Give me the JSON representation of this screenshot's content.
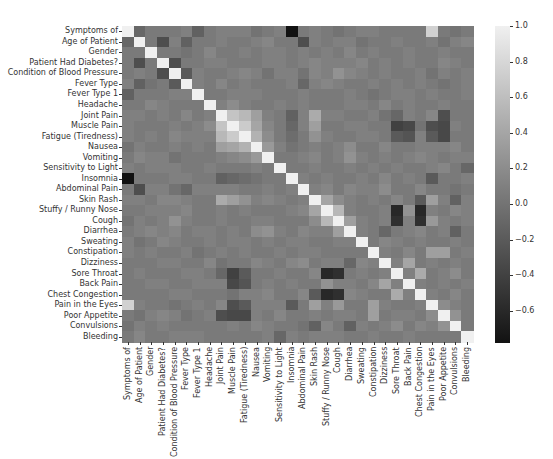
{
  "chart_data": {
    "type": "heatmap",
    "title": "",
    "xlabel": "",
    "ylabel": "",
    "labels": [
      "Symptoms of",
      "Age of Patient",
      "Gender",
      "Patient Had Diabetes?",
      "Condition of Blood Pressure",
      "Fever Type",
      "Fever Type 1",
      "Headache",
      "Joint Pain",
      "Muscle Pain",
      "Fatigue (Tiredness)",
      "Nausea",
      "Vomiting",
      "Sensitivity to Light",
      "Insomnia",
      "Abdominal Pain",
      "Skin Rash",
      "Stuffy / Runny Nose",
      "Cough",
      "Diarrhea",
      "Sweating",
      "Constipation",
      "Dizziness",
      "Sore Throat",
      "Back Pain",
      "Chest Congestion",
      "Pain in the Eyes",
      "Poor Appetite",
      "Convulsions",
      "Bleeding"
    ],
    "colorbar": {
      "min": -0.78,
      "max": 1.0,
      "ticks": [
        1.0,
        0.8,
        0.6,
        0.4,
        0.2,
        0.0,
        -0.2,
        -0.4,
        -0.6
      ],
      "tick_labels": [
        "1.0",
        "0.8",
        "0.6",
        "0.4",
        "0.2",
        "0.0",
        "−0.2",
        "−0.4",
        "−0.6"
      ],
      "colormap": "gray",
      "low_color": "#121212",
      "high_color": "#f0f0f0"
    },
    "matrix": [
      [
        1.0,
        -0.1,
        0.05,
        0.05,
        0.05,
        0.1,
        -0.15,
        0.05,
        0.1,
        0.1,
        0.1,
        0.0,
        0.05,
        0.1,
        -0.78,
        0.05,
        0.1,
        0.05,
        0.0,
        0.05,
        0.1,
        0.1,
        0.05,
        0.05,
        0.05,
        0.05,
        0.75,
        0.05,
        0.0,
        0.05
      ],
      [
        -0.1,
        1.0,
        0.05,
        -0.3,
        0.1,
        -0.15,
        0.05,
        0.05,
        0.1,
        0.05,
        0.05,
        0.1,
        0.15,
        0.05,
        0.05,
        -0.3,
        0.1,
        0.05,
        0.1,
        0.1,
        0.0,
        0.05,
        0.05,
        0.1,
        0.05,
        0.05,
        0.1,
        0.0,
        0.1,
        0.15
      ],
      [
        0.05,
        0.05,
        1.0,
        0.05,
        0.05,
        0.0,
        0.05,
        0.15,
        0.05,
        0.05,
        0.1,
        0.05,
        0.1,
        0.1,
        0.05,
        0.1,
        0.05,
        0.1,
        0.05,
        0.15,
        0.05,
        0.1,
        0.05,
        0.05,
        0.1,
        0.05,
        0.05,
        0.1,
        0.05,
        0.05
      ],
      [
        0.05,
        -0.3,
        0.05,
        1.0,
        -0.3,
        0.05,
        0.05,
        0.1,
        0.1,
        0.05,
        0.05,
        0.05,
        0.1,
        0.1,
        0.05,
        0.1,
        0.15,
        0.1,
        0.1,
        0.1,
        0.15,
        0.05,
        0.1,
        0.05,
        0.1,
        0.05,
        0.05,
        0.15,
        0.1,
        0.05
      ],
      [
        0.05,
        0.1,
        0.05,
        -0.3,
        1.0,
        -0.2,
        0.1,
        0.05,
        0.05,
        0.1,
        0.15,
        0.1,
        0.0,
        0.1,
        0.1,
        0.0,
        0.15,
        0.1,
        0.25,
        0.15,
        0.1,
        0.05,
        0.1,
        0.05,
        0.05,
        0.1,
        0.0,
        0.1,
        0.05,
        0.1
      ],
      [
        0.1,
        -0.15,
        0.0,
        0.05,
        -0.2,
        1.0,
        0.1,
        0.05,
        0.15,
        0.05,
        0.1,
        0.05,
        0.05,
        0.05,
        0.1,
        -0.1,
        0.1,
        0.15,
        0.1,
        0.05,
        0.05,
        0.1,
        0.05,
        0.1,
        0.05,
        0.1,
        0.05,
        0.0,
        0.05,
        0.1
      ],
      [
        -0.15,
        0.05,
        0.05,
        0.05,
        0.1,
        0.1,
        1.0,
        0.05,
        0.05,
        0.1,
        0.1,
        0.1,
        0.05,
        0.05,
        0.05,
        0.1,
        0.05,
        0.05,
        0.05,
        0.1,
        0.05,
        0.0,
        0.05,
        0.1,
        0.1,
        0.05,
        0.1,
        0.05,
        0.05,
        0.1
      ],
      [
        0.05,
        0.05,
        0.15,
        0.1,
        0.05,
        0.05,
        0.05,
        1.0,
        0.1,
        0.2,
        0.1,
        0.05,
        0.05,
        0.1,
        0.05,
        0.1,
        0.05,
        0.05,
        0.05,
        0.1,
        0.1,
        0.05,
        0.15,
        0.05,
        0.1,
        0.05,
        0.05,
        0.1,
        0.05,
        0.05
      ],
      [
        0.1,
        0.1,
        0.05,
        0.1,
        0.05,
        0.15,
        0.05,
        0.1,
        1.0,
        0.65,
        0.55,
        0.35,
        0.1,
        0.05,
        -0.15,
        0.1,
        0.45,
        0.1,
        0.1,
        0.05,
        0.05,
        0.1,
        0.0,
        -0.1,
        0.1,
        0.05,
        0.15,
        -0.3,
        0.05,
        0.05
      ],
      [
        0.1,
        0.05,
        0.05,
        0.05,
        0.1,
        0.05,
        0.1,
        0.2,
        0.65,
        1.0,
        0.7,
        0.4,
        0.15,
        0.05,
        -0.1,
        0.1,
        0.35,
        0.05,
        0.05,
        0.1,
        0.1,
        0.05,
        0.05,
        -0.4,
        -0.35,
        0.0,
        -0.3,
        -0.35,
        0.1,
        0.05
      ],
      [
        0.1,
        0.05,
        0.1,
        0.05,
        0.15,
        0.1,
        0.1,
        0.1,
        0.55,
        0.7,
        1.0,
        0.5,
        0.2,
        0.05,
        -0.05,
        0.05,
        0.25,
        0.1,
        0.05,
        0.05,
        0.1,
        0.1,
        0.05,
        -0.2,
        -0.25,
        0.1,
        -0.2,
        -0.35,
        0.05,
        0.05
      ],
      [
        0.0,
        0.1,
        0.05,
        0.05,
        0.1,
        0.05,
        0.1,
        0.05,
        0.35,
        0.4,
        0.5,
        1.0,
        0.3,
        0.1,
        0.0,
        0.05,
        0.1,
        0.05,
        0.1,
        0.2,
        0.05,
        0.05,
        0.15,
        0.05,
        0.05,
        0.1,
        0.1,
        0.1,
        0.15,
        0.05
      ],
      [
        0.05,
        0.15,
        0.1,
        0.1,
        0.0,
        0.05,
        0.05,
        0.05,
        0.1,
        0.15,
        0.2,
        0.3,
        1.0,
        0.05,
        0.05,
        0.1,
        0.15,
        0.05,
        0.1,
        0.25,
        0.1,
        0.05,
        0.1,
        0.05,
        0.1,
        0.15,
        0.1,
        0.05,
        0.1,
        0.1
      ],
      [
        0.1,
        0.05,
        0.1,
        0.1,
        0.1,
        0.05,
        0.05,
        0.1,
        0.05,
        0.05,
        0.05,
        0.1,
        0.05,
        1.0,
        0.05,
        0.05,
        0.1,
        0.05,
        0.05,
        0.1,
        0.05,
        0.1,
        0.05,
        0.1,
        0.05,
        0.05,
        0.1,
        0.15,
        0.05,
        -0.1
      ],
      [
        -0.78,
        0.05,
        0.05,
        0.05,
        0.1,
        0.1,
        0.05,
        0.05,
        -0.15,
        -0.1,
        -0.05,
        0.0,
        0.05,
        0.05,
        1.0,
        0.1,
        0.05,
        0.1,
        0.05,
        0.05,
        0.1,
        0.05,
        0.15,
        0.05,
        0.1,
        0.05,
        -0.2,
        0.05,
        0.05,
        0.1
      ],
      [
        0.05,
        -0.3,
        0.1,
        0.1,
        0.0,
        -0.1,
        0.1,
        0.1,
        0.1,
        0.1,
        0.05,
        0.05,
        0.1,
        0.05,
        0.1,
        1.0,
        0.1,
        0.15,
        0.05,
        0.15,
        0.1,
        0.1,
        0.2,
        0.05,
        0.05,
        0.15,
        0.05,
        0.05,
        0.0,
        0.05
      ],
      [
        0.1,
        0.1,
        0.05,
        0.15,
        0.15,
        0.1,
        0.05,
        0.05,
        0.45,
        0.35,
        0.25,
        0.1,
        0.15,
        0.1,
        0.05,
        0.1,
        1.0,
        0.4,
        0.2,
        0.1,
        0.05,
        0.1,
        0.05,
        0.15,
        0.05,
        -0.2,
        0.35,
        0.1,
        -0.15,
        0.1
      ],
      [
        0.05,
        0.05,
        0.1,
        0.1,
        0.1,
        0.15,
        0.05,
        0.05,
        0.1,
        0.05,
        0.1,
        0.05,
        0.05,
        0.05,
        0.1,
        0.15,
        0.4,
        1.0,
        0.55,
        0.1,
        0.05,
        0.05,
        0.1,
        -0.6,
        0.25,
        -0.6,
        0.1,
        0.05,
        0.15,
        0.1
      ],
      [
        0.0,
        0.1,
        0.05,
        0.1,
        0.25,
        0.1,
        0.05,
        0.05,
        0.1,
        0.05,
        0.05,
        0.1,
        0.1,
        0.05,
        0.05,
        0.05,
        0.2,
        0.55,
        1.0,
        0.35,
        0.1,
        0.05,
        0.1,
        -0.55,
        0.1,
        -0.55,
        0.3,
        0.1,
        0.05,
        0.1
      ],
      [
        0.05,
        0.1,
        0.15,
        0.1,
        0.15,
        0.05,
        0.1,
        0.1,
        0.05,
        0.1,
        0.05,
        0.2,
        0.25,
        0.1,
        0.05,
        0.15,
        0.1,
        0.1,
        0.35,
        1.0,
        0.1,
        0.05,
        -0.1,
        0.05,
        0.1,
        0.15,
        0.05,
        0.1,
        -0.15,
        0.05
      ],
      [
        0.1,
        0.0,
        0.05,
        0.15,
        0.1,
        0.05,
        0.05,
        0.1,
        0.05,
        0.1,
        0.1,
        0.05,
        0.1,
        0.05,
        0.1,
        0.1,
        0.05,
        0.05,
        0.1,
        0.1,
        1.0,
        0.05,
        0.15,
        0.1,
        0.05,
        0.1,
        0.05,
        0.05,
        0.1,
        0.05
      ],
      [
        0.1,
        0.05,
        0.1,
        0.05,
        0.05,
        0.1,
        0.0,
        0.05,
        0.1,
        0.05,
        0.1,
        0.05,
        0.05,
        0.1,
        0.05,
        0.1,
        0.1,
        0.05,
        0.05,
        0.05,
        0.05,
        1.0,
        0.1,
        0.05,
        0.15,
        0.05,
        0.35,
        0.35,
        0.05,
        0.1
      ],
      [
        0.05,
        0.05,
        0.05,
        0.1,
        0.1,
        0.05,
        0.05,
        0.15,
        0.0,
        0.05,
        0.05,
        0.15,
        0.1,
        0.05,
        0.15,
        0.2,
        0.05,
        0.1,
        0.1,
        -0.1,
        0.15,
        0.1,
        1.0,
        0.1,
        0.4,
        0.05,
        0.1,
        0.05,
        0.1,
        0.05
      ],
      [
        0.05,
        0.1,
        0.05,
        0.05,
        0.05,
        0.1,
        0.1,
        0.05,
        -0.1,
        -0.4,
        -0.2,
        0.05,
        0.05,
        0.1,
        0.05,
        0.05,
        0.15,
        -0.6,
        -0.55,
        0.05,
        0.1,
        0.05,
        0.1,
        1.0,
        0.1,
        0.45,
        0.05,
        0.1,
        0.2,
        0.05
      ],
      [
        0.05,
        0.05,
        0.1,
        0.1,
        0.05,
        0.05,
        0.1,
        0.1,
        0.1,
        -0.35,
        -0.25,
        0.05,
        0.1,
        0.05,
        0.1,
        0.05,
        0.05,
        0.25,
        0.1,
        0.1,
        0.05,
        0.15,
        0.4,
        0.1,
        1.0,
        0.1,
        0.05,
        0.1,
        0.05,
        0.1
      ],
      [
        0.05,
        0.05,
        0.05,
        0.05,
        0.1,
        0.1,
        0.05,
        0.05,
        0.05,
        0.0,
        0.1,
        0.1,
        0.15,
        0.05,
        0.05,
        0.15,
        -0.2,
        -0.6,
        -0.55,
        0.15,
        0.1,
        0.05,
        0.05,
        0.45,
        0.1,
        1.0,
        0.1,
        0.05,
        0.15,
        0.05
      ],
      [
        0.75,
        0.1,
        0.05,
        0.05,
        0.0,
        0.05,
        0.1,
        0.05,
        0.15,
        -0.3,
        -0.2,
        0.1,
        0.1,
        0.1,
        -0.2,
        0.05,
        0.35,
        0.1,
        0.3,
        0.05,
        0.05,
        0.35,
        0.1,
        0.05,
        0.05,
        0.1,
        1.0,
        0.2,
        0.1,
        0.05
      ],
      [
        0.05,
        0.0,
        0.1,
        0.15,
        0.1,
        0.0,
        0.05,
        0.1,
        -0.3,
        -0.35,
        -0.35,
        0.1,
        0.05,
        0.15,
        0.05,
        0.05,
        0.1,
        0.05,
        0.1,
        0.1,
        0.05,
        0.35,
        0.05,
        0.1,
        0.1,
        0.05,
        0.2,
        1.0,
        0.25,
        0.05
      ],
      [
        0.0,
        0.1,
        0.05,
        0.1,
        0.05,
        0.05,
        0.05,
        0.05,
        0.05,
        0.1,
        0.05,
        0.15,
        0.1,
        0.05,
        0.05,
        0.0,
        -0.15,
        0.15,
        0.05,
        -0.15,
        0.1,
        0.05,
        0.1,
        0.2,
        0.05,
        0.15,
        0.1,
        0.25,
        1.0,
        0.05
      ],
      [
        0.05,
        0.15,
        0.05,
        0.05,
        0.1,
        0.1,
        0.1,
        0.05,
        0.05,
        0.05,
        0.05,
        0.05,
        0.1,
        -0.1,
        0.1,
        0.05,
        0.1,
        0.1,
        0.1,
        0.05,
        0.05,
        0.1,
        0.05,
        0.05,
        0.1,
        0.05,
        0.05,
        0.05,
        0.05,
        1.0
      ]
    ]
  }
}
